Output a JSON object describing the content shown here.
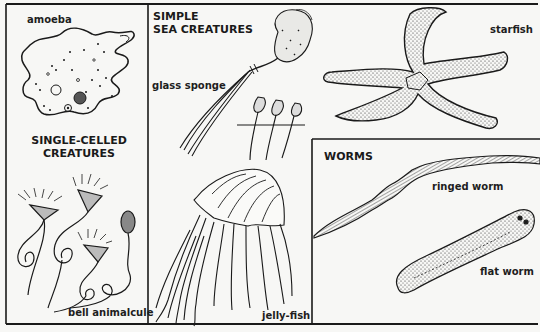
{
  "sections": {
    "single_celled": {
      "heading_line1": "SINGLE-CELLED",
      "heading_line2": "CREATURES",
      "labels": {
        "amoeba": "amoeba",
        "bell_animalcule": "bell animalcule"
      }
    },
    "simple_sea": {
      "heading_line1": "SIMPLE",
      "heading_line2": "SEA CREATURES",
      "labels": {
        "glass_sponge": "glass sponge",
        "starfish": "starfish",
        "jellyfish": "jelly-fish"
      }
    },
    "worms": {
      "heading": "WORMS",
      "labels": {
        "ringed_worm": "ringed worm",
        "flat_worm": "flat worm"
      }
    }
  },
  "colors": {
    "background": "#f7f7f5",
    "ink": "#1a1a1a"
  }
}
